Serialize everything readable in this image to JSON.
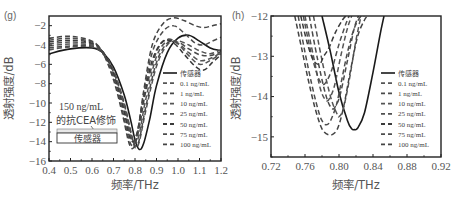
{
  "chart_data": [
    {
      "panel": "(g)",
      "type": "line",
      "xlabel": "频率/THz",
      "ylabel": "透射强度/dB",
      "xlim": [
        0.4,
        1.2
      ],
      "ylim": [
        -16,
        -1
      ],
      "xticks": [
        0.4,
        0.5,
        0.6,
        0.7,
        0.8,
        0.9,
        1.0,
        1.1,
        1.2
      ],
      "xtick_labels": [
        "0.4",
        "0.5",
        "0.6",
        "0.7",
        "0.8",
        "0.9",
        "1.0",
        "1.1",
        "1.2"
      ],
      "yticks": [
        -2,
        -4,
        -6,
        -8,
        -10,
        -12,
        -14,
        -16
      ],
      "ytick_labels": [
        "−2",
        "−4",
        "−6",
        "−8",
        "−10",
        "−12",
        "−14",
        "−16"
      ],
      "grid": false,
      "legend_position": "right",
      "annotation": {
        "line1": "150 ng/mL",
        "line2": "的抗CEA修饰",
        "box_label": "传感器"
      },
      "series": [
        {
          "name": "传感器",
          "style": "solid",
          "x": [
            0.4,
            0.5,
            0.6,
            0.65,
            0.7,
            0.75,
            0.78,
            0.8,
            0.82,
            0.84,
            0.87,
            0.9,
            0.95,
            1.0,
            1.05,
            1.1,
            1.15,
            1.2
          ],
          "y": [
            -4.9,
            -4.4,
            -4.3,
            -4.8,
            -6.3,
            -9.2,
            -11.8,
            -13.8,
            -14.8,
            -14.2,
            -11.5,
            -8.2,
            -4.8,
            -3.3,
            -3.0,
            -3.6,
            -4.3,
            -4.6
          ]
        },
        {
          "name": "0.1 ng/mL",
          "style": "dashed",
          "x": [
            0.4,
            0.5,
            0.6,
            0.65,
            0.7,
            0.75,
            0.78,
            0.8,
            0.82,
            0.85,
            0.9,
            0.95,
            1.0,
            1.05,
            1.1,
            1.15,
            1.2
          ],
          "y": [
            -4.5,
            -4.2,
            -4.2,
            -4.9,
            -6.8,
            -10.2,
            -13.0,
            -14.6,
            -14.0,
            -10.8,
            -6.2,
            -4.0,
            -3.6,
            -4.0,
            -4.6,
            -4.9,
            -4.5
          ]
        },
        {
          "name": "1 ng/mL",
          "style": "dashed",
          "x": [
            0.4,
            0.5,
            0.6,
            0.65,
            0.7,
            0.75,
            0.78,
            0.8,
            0.82,
            0.85,
            0.9,
            0.95,
            1.0,
            1.05,
            1.1,
            1.15,
            1.2
          ],
          "y": [
            -4.3,
            -4.1,
            -4.1,
            -4.8,
            -6.6,
            -10.0,
            -12.9,
            -14.4,
            -13.8,
            -10.4,
            -5.8,
            -3.8,
            -3.7,
            -4.4,
            -5.0,
            -5.1,
            -4.7
          ]
        },
        {
          "name": "10 ng/mL",
          "style": "dashed",
          "x": [
            0.4,
            0.5,
            0.6,
            0.65,
            0.7,
            0.75,
            0.78,
            0.8,
            0.82,
            0.85,
            0.9,
            0.95,
            1.0,
            1.05,
            1.1,
            1.15,
            1.2
          ],
          "y": [
            -4.1,
            -3.9,
            -4.0,
            -4.7,
            -6.7,
            -10.3,
            -13.3,
            -14.2,
            -13.2,
            -9.6,
            -5.2,
            -3.6,
            -3.8,
            -4.8,
            -5.6,
            -5.4,
            -4.8
          ]
        },
        {
          "name": "25 ng/mL",
          "style": "dashed",
          "x": [
            0.4,
            0.5,
            0.6,
            0.65,
            0.7,
            0.75,
            0.78,
            0.8,
            0.82,
            0.85,
            0.9,
            0.95,
            1.0,
            1.05,
            1.1,
            1.15,
            1.2
          ],
          "y": [
            -3.9,
            -3.7,
            -3.9,
            -4.7,
            -6.9,
            -10.7,
            -13.6,
            -13.9,
            -12.6,
            -8.8,
            -4.7,
            -3.4,
            -3.9,
            -5.1,
            -6.0,
            -5.6,
            -4.9
          ]
        },
        {
          "name": "50 ng/mL",
          "style": "dashed",
          "x": [
            0.4,
            0.5,
            0.6,
            0.65,
            0.7,
            0.75,
            0.77,
            0.79,
            0.81,
            0.84,
            0.88,
            0.93,
            0.98,
            1.03,
            1.08,
            1.12,
            1.16,
            1.2
          ],
          "y": [
            -3.7,
            -3.5,
            -3.8,
            -4.7,
            -7.0,
            -11.0,
            -13.2,
            -14.0,
            -13.0,
            -9.6,
            -5.6,
            -3.6,
            -3.8,
            -5.0,
            -6.2,
            -6.6,
            -5.8,
            -5.0
          ]
        },
        {
          "name": "75 ng/mL",
          "style": "dashed",
          "x": [
            0.4,
            0.5,
            0.6,
            0.65,
            0.7,
            0.74,
            0.77,
            0.79,
            0.81,
            0.84,
            0.88,
            0.93,
            0.98,
            1.03,
            1.08,
            1.12,
            1.16,
            1.2
          ],
          "y": [
            -3.5,
            -3.3,
            -3.7,
            -4.8,
            -7.3,
            -10.6,
            -13.6,
            -14.4,
            -13.2,
            -9.2,
            -4.8,
            -2.6,
            -2.0,
            -2.8,
            -3.8,
            -4.0,
            -3.6,
            -3.2
          ]
        },
        {
          "name": "100 ng/mL",
          "style": "dashed",
          "x": [
            0.4,
            0.5,
            0.6,
            0.65,
            0.7,
            0.74,
            0.77,
            0.79,
            0.81,
            0.84,
            0.88,
            0.93,
            0.98,
            1.03,
            1.08,
            1.12,
            1.16,
            1.2
          ],
          "y": [
            -3.3,
            -3.1,
            -3.6,
            -4.8,
            -7.6,
            -11.0,
            -14.0,
            -14.7,
            -13.4,
            -8.8,
            -4.0,
            -1.8,
            -1.2,
            -1.5,
            -2.0,
            -2.2,
            -2.0,
            -1.8
          ]
        }
      ]
    },
    {
      "panel": "(h)",
      "type": "line",
      "xlabel": "频率/THz",
      "ylabel": "透射强度/dB",
      "xlim": [
        0.72,
        0.92
      ],
      "ylim": [
        -15.5,
        -12
      ],
      "xticks": [
        0.72,
        0.76,
        0.8,
        0.84,
        0.88,
        0.92
      ],
      "xtick_labels": [
        "0.72",
        "0.76",
        "0.80",
        "0.84",
        "0.88",
        "0.92"
      ],
      "yticks": [
        -12,
        -13,
        -14,
        -15
      ],
      "ytick_labels": [
        "−12",
        "−13",
        "−14",
        "−15"
      ],
      "grid": false,
      "legend_position": "right",
      "series": [
        {
          "name": "传感器",
          "style": "solid",
          "x": [
            0.78,
            0.79,
            0.8,
            0.81,
            0.815,
            0.818,
            0.822,
            0.83,
            0.84,
            0.848,
            0.853
          ],
          "y": [
            -12.0,
            -12.9,
            -13.9,
            -14.6,
            -14.8,
            -14.82,
            -14.78,
            -14.4,
            -13.4,
            -12.5,
            -12.0
          ]
        },
        {
          "name": "0.1 ng/mL",
          "style": "dashed",
          "x": [
            0.77,
            0.78,
            0.79,
            0.797,
            0.8,
            0.805,
            0.812,
            0.82,
            0.826
          ],
          "y": [
            -12.0,
            -13.1,
            -14.0,
            -14.4,
            -14.5,
            -14.3,
            -13.6,
            -12.6,
            -12.0
          ]
        },
        {
          "name": "1 ng/mL",
          "style": "dashed",
          "x": [
            0.765,
            0.775,
            0.785,
            0.792,
            0.797,
            0.802,
            0.81,
            0.818,
            0.823
          ],
          "y": [
            -12.0,
            -13.1,
            -14.0,
            -14.3,
            -14.2,
            -13.9,
            -13.1,
            -12.3,
            -12.0
          ]
        },
        {
          "name": "10 ng/mL",
          "style": "dashed",
          "x": [
            0.76,
            0.77,
            0.778,
            0.785,
            0.79,
            0.795,
            0.803,
            0.81,
            0.815
          ],
          "y": [
            -12.0,
            -13.0,
            -13.8,
            -14.1,
            -14.0,
            -13.7,
            -12.9,
            -12.3,
            -12.0
          ]
        },
        {
          "name": "25 ng/mL",
          "style": "dashed",
          "x": [
            0.758,
            0.767,
            0.775,
            0.781,
            0.786,
            0.792,
            0.8,
            0.808,
            0.812
          ],
          "y": [
            -12.0,
            -12.9,
            -13.5,
            -13.7,
            -13.6,
            -13.3,
            -12.7,
            -12.2,
            -12.0
          ]
        },
        {
          "name": "50 ng/mL",
          "style": "dashed",
          "x": [
            0.755,
            0.763,
            0.77,
            0.777,
            0.782,
            0.788,
            0.796,
            0.804,
            0.808
          ],
          "y": [
            -12.0,
            -12.7,
            -13.1,
            -13.2,
            -13.0,
            -12.8,
            -12.4,
            -12.1,
            -12.0
          ]
        },
        {
          "name": "75 ng/mL",
          "style": "dashed",
          "x": [
            0.752,
            0.76,
            0.768,
            0.775,
            0.78,
            0.785,
            0.79,
            0.797,
            0.803,
            0.81,
            0.818,
            0.826,
            0.83
          ],
          "y": [
            -12.0,
            -12.9,
            -13.7,
            -14.3,
            -14.6,
            -14.7,
            -14.6,
            -14.2,
            -13.6,
            -12.9,
            -12.3,
            -12.0,
            -12.0
          ]
        },
        {
          "name": "100 ng/mL",
          "style": "dashed",
          "x": [
            0.748,
            0.756,
            0.764,
            0.772,
            0.78,
            0.788,
            0.795,
            0.8,
            0.806,
            0.814,
            0.822,
            0.83,
            0.834
          ],
          "y": [
            -12.0,
            -12.8,
            -13.6,
            -14.3,
            -14.8,
            -14.95,
            -14.9,
            -14.7,
            -14.2,
            -13.3,
            -12.5,
            -12.1,
            -12.0
          ]
        }
      ]
    }
  ]
}
